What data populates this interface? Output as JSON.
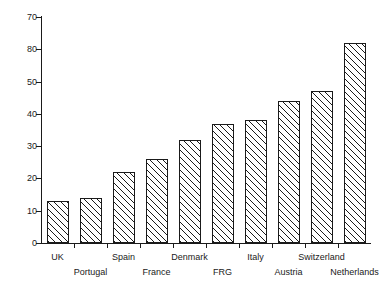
{
  "chart_data": {
    "type": "bar",
    "title": "",
    "subtitle": "",
    "xlabel": "",
    "ylabel": "",
    "ylim": [
      0,
      70
    ],
    "yticks": [
      0,
      10,
      20,
      30,
      40,
      50,
      60,
      70
    ],
    "ytick_labels": [
      "0",
      "10",
      "20",
      "30",
      "40",
      "50",
      "80",
      "70"
    ],
    "grid": false,
    "legend": null,
    "categories": [
      "UK",
      "Portugal",
      "Spain",
      "France",
      "Denmark",
      "FRG",
      "Italy",
      "Austria",
      "Switzerland",
      "Netherlands"
    ],
    "values": [
      13,
      14,
      22,
      26,
      32,
      37,
      38,
      44,
      47,
      62
    ],
    "bar_style": {
      "fill": "#ffffff",
      "edge": "#1a1a1a",
      "hatch": "diagonal-45"
    },
    "label_rows": [
      "top",
      "bottom",
      "top",
      "bottom",
      "top",
      "bottom",
      "top",
      "bottom",
      "top",
      "bottom"
    ]
  }
}
